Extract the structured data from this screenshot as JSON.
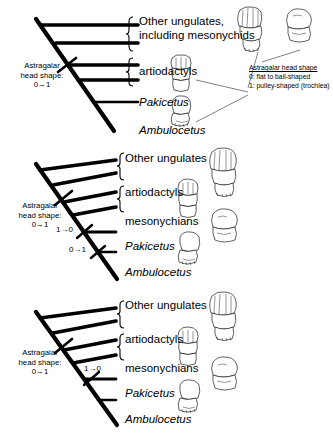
{
  "figure": {
    "root_annotation_line1": "Astragalar",
    "root_annotation_line2": "head shape:",
    "root_annotation_line3": "0→1"
  },
  "legend": {
    "title": "Astragalar head shape",
    "state_0": "0: flat to ball-shaped",
    "state_1": "1: pulley-shaped (trochlea)"
  },
  "panels": [
    {
      "id": "panel-1",
      "taxa": [
        {
          "label": "Other ungulates,",
          "label2": "including mesonychids",
          "italic": false
        },
        {
          "label": "artiodactyls",
          "italic": false
        },
        {
          "label": "Pakicetus",
          "italic": true
        },
        {
          "label": "Ambulocetus",
          "italic": true
        }
      ],
      "annotations": []
    },
    {
      "id": "panel-2",
      "taxa": [
        {
          "label": "Other ungulates",
          "italic": false
        },
        {
          "label": "artiodactyls",
          "italic": false
        },
        {
          "label": "mesonychians",
          "italic": false
        },
        {
          "label": "Pakicetus",
          "italic": true
        },
        {
          "label": "Ambulocetus",
          "italic": true
        }
      ],
      "annotations": [
        {
          "text": "1→0"
        },
        {
          "text": "0→1"
        }
      ]
    },
    {
      "id": "panel-3",
      "taxa": [
        {
          "label": "Other ungulates",
          "italic": false
        },
        {
          "label": "artiodactyls",
          "italic": false
        },
        {
          "label": "mesonychians",
          "italic": false
        },
        {
          "label": "Pakicetus",
          "italic": true
        },
        {
          "label": "Ambulocetus",
          "italic": true
        }
      ],
      "annotations": [
        {
          "text": "1→0"
        }
      ]
    }
  ],
  "colors": {
    "ink": "#000000",
    "background": "#ffffff",
    "bone_outline": "#2b2b2b"
  }
}
